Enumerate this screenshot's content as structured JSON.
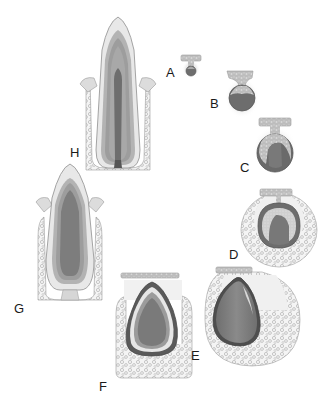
{
  "figure": {
    "colors": {
      "background": "#ffffff",
      "outline": "#8a8a8a",
      "enamel": "#e2e2e2",
      "dentin_band_1": "#a9a9a9",
      "dentin_band_2": "#9a9a9a",
      "dentin_band_3": "#b8b8b8",
      "pulp": "#7c7c7c",
      "pulp_dark": "#5e5e5e",
      "bone": "#f2f2f2",
      "epithelium": "#bcbcbc",
      "halo": "#ececec",
      "label": "#1a1a1a"
    },
    "stages": [
      {
        "id": "A",
        "label": "A",
        "name": "bud stage"
      },
      {
        "id": "B",
        "label": "B",
        "name": "cap stage (early)"
      },
      {
        "id": "C",
        "label": "C",
        "name": "cap stage (late)"
      },
      {
        "id": "D",
        "label": "D",
        "name": "bell stage (early)"
      },
      {
        "id": "E",
        "label": "E",
        "name": "bell stage (late)"
      },
      {
        "id": "F",
        "label": "F",
        "name": "crown formation"
      },
      {
        "id": "G",
        "label": "G",
        "name": "eruption"
      },
      {
        "id": "H",
        "label": "H",
        "name": "erupted tooth"
      }
    ]
  }
}
